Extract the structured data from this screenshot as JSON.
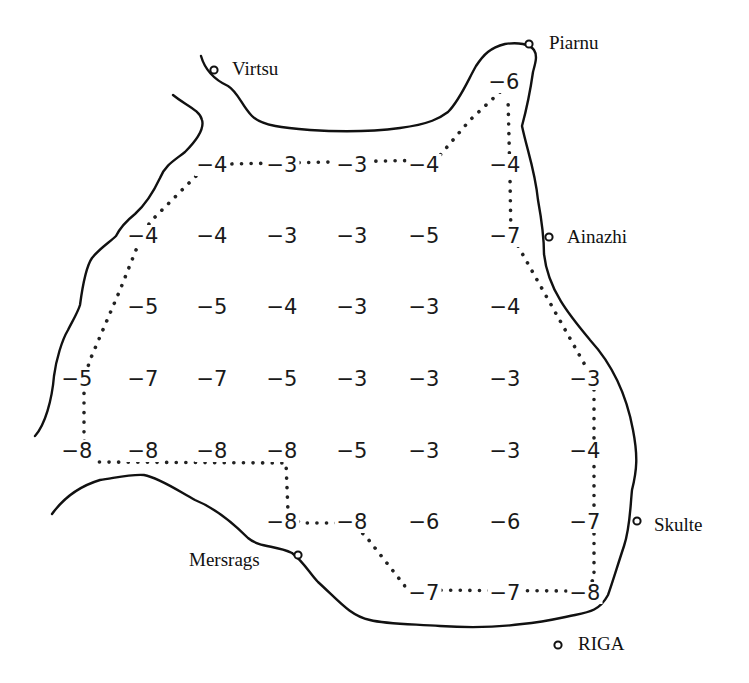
{
  "diagram": {
    "type": "depth-map",
    "towns": [
      {
        "name": "Virtsu",
        "x": 213,
        "y": 70,
        "label_x": 232,
        "label_y": 59
      },
      {
        "name": "Piarnu",
        "x": 529,
        "y": 44,
        "label_x": 549,
        "label_y": 33
      },
      {
        "name": "Ainazhi",
        "x": 549,
        "y": 237,
        "label_x": 567,
        "label_y": 227
      },
      {
        "name": "Skulte",
        "x": 637,
        "y": 521,
        "label_x": 654,
        "label_y": 515
      },
      {
        "name": "Mersrags",
        "x": 298,
        "y": 555,
        "label_x": 189,
        "label_y": 550
      },
      {
        "name": "RIGA",
        "x": 558,
        "y": 645,
        "label_x": 578,
        "label_y": 634
      }
    ],
    "grid_values": [
      {
        "v": "−6",
        "x": 504,
        "y": 82
      },
      {
        "v": "−4",
        "x": 212,
        "y": 165
      },
      {
        "v": "−3",
        "x": 282,
        "y": 165
      },
      {
        "v": "−3",
        "x": 352,
        "y": 165
      },
      {
        "v": "−4",
        "x": 424,
        "y": 165
      },
      {
        "v": "−4",
        "x": 505,
        "y": 165
      },
      {
        "v": "−4",
        "x": 143,
        "y": 236
      },
      {
        "v": "−4",
        "x": 212,
        "y": 236
      },
      {
        "v": "−3",
        "x": 282,
        "y": 236
      },
      {
        "v": "−3",
        "x": 352,
        "y": 236
      },
      {
        "v": "−5",
        "x": 424,
        "y": 236
      },
      {
        "v": "−7",
        "x": 505,
        "y": 236
      },
      {
        "v": "−5",
        "x": 143,
        "y": 307
      },
      {
        "v": "−5",
        "x": 212,
        "y": 307
      },
      {
        "v": "−4",
        "x": 282,
        "y": 307
      },
      {
        "v": "−3",
        "x": 352,
        "y": 307
      },
      {
        "v": "−3",
        "x": 424,
        "y": 307
      },
      {
        "v": "−4",
        "x": 505,
        "y": 307
      },
      {
        "v": "−5",
        "x": 77,
        "y": 379
      },
      {
        "v": "−7",
        "x": 143,
        "y": 379
      },
      {
        "v": "−7",
        "x": 212,
        "y": 379
      },
      {
        "v": "−5",
        "x": 282,
        "y": 379
      },
      {
        "v": "−3",
        "x": 352,
        "y": 379
      },
      {
        "v": "−3",
        "x": 424,
        "y": 379
      },
      {
        "v": "−3",
        "x": 505,
        "y": 379
      },
      {
        "v": "−3",
        "x": 585,
        "y": 379
      },
      {
        "v": "−8",
        "x": 77,
        "y": 451
      },
      {
        "v": "−8",
        "x": 143,
        "y": 451
      },
      {
        "v": "−8",
        "x": 212,
        "y": 451
      },
      {
        "v": "−8",
        "x": 282,
        "y": 451
      },
      {
        "v": "−5",
        "x": 352,
        "y": 451
      },
      {
        "v": "−3",
        "x": 424,
        "y": 451
      },
      {
        "v": "−3",
        "x": 505,
        "y": 451
      },
      {
        "v": "−4",
        "x": 585,
        "y": 451
      },
      {
        "v": "−8",
        "x": 282,
        "y": 522
      },
      {
        "v": "−8",
        "x": 352,
        "y": 522
      },
      {
        "v": "−6",
        "x": 424,
        "y": 522
      },
      {
        "v": "−6",
        "x": 505,
        "y": 522
      },
      {
        "v": "−7",
        "x": 585,
        "y": 522
      },
      {
        "v": "−7",
        "x": 424,
        "y": 593
      },
      {
        "v": "−7",
        "x": 505,
        "y": 593
      },
      {
        "v": "−8",
        "x": 585,
        "y": 593
      }
    ]
  }
}
